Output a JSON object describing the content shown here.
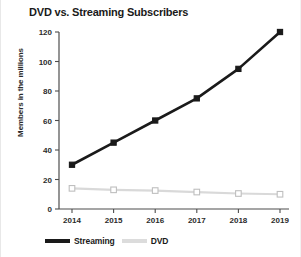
{
  "chart_data": {
    "type": "line",
    "title": "DVD vs. Streaming Subscribers",
    "xlabel": "",
    "ylabel": "Members in the millions",
    "categories": [
      "2014",
      "2015",
      "2016",
      "2017",
      "2018",
      "2019"
    ],
    "ylim": [
      0,
      120
    ],
    "yticks": [
      0,
      20,
      40,
      60,
      80,
      100,
      120
    ],
    "grid": false,
    "legend_position": "bottom-left",
    "series": [
      {
        "name": "Streaming",
        "color": "#1a1a1a",
        "marker": "filled-square",
        "values": [
          30,
          45,
          60,
          75,
          95,
          120
        ]
      },
      {
        "name": "DVD",
        "color": "#d9d9d9",
        "marker": "open-square",
        "values": [
          14,
          13,
          12.5,
          11.5,
          10.5,
          10
        ]
      }
    ]
  },
  "axes": {
    "y_tick_labels": [
      "120",
      "100",
      "80",
      "60",
      "40",
      "20",
      "0"
    ],
    "x_tick_labels": [
      "2014",
      "2015",
      "2016",
      "2017",
      "2018",
      "2019"
    ]
  },
  "legend": {
    "entries": [
      {
        "label": "Streaming",
        "color": "#1a1a1a"
      },
      {
        "label": "DVD",
        "color": "#dcdcdc"
      }
    ]
  }
}
